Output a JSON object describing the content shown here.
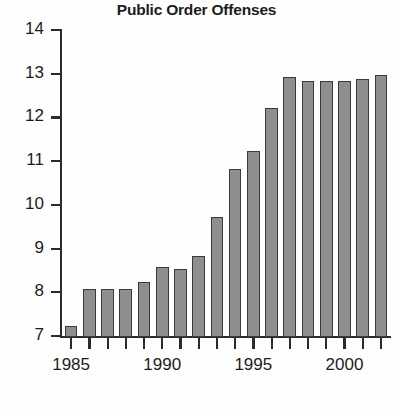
{
  "chart_data": {
    "type": "bar",
    "title": "Public Order Offenses",
    "xlabel": "",
    "ylabel": "",
    "ylim": [
      7,
      14
    ],
    "yticks": [
      7,
      8,
      9,
      10,
      11,
      12,
      13,
      14
    ],
    "ytick_labels": [
      "7",
      "8",
      "9",
      "10",
      "11",
      "12",
      "13",
      "14"
    ],
    "xlim": [
      1984.5,
      2002.5
    ],
    "xtick_labels": [
      "1985",
      "1990",
      "1995",
      "2000"
    ],
    "xticks_major": [
      1985,
      1990,
      1995,
      2000
    ],
    "grid": false,
    "legend": false,
    "bar_color": "#8e8e8e",
    "bar_edge_color": "#3a3a3a",
    "axis_color": "#2b2b2b",
    "categories": [
      "1985",
      "1986",
      "1987",
      "1988",
      "1989",
      "1990",
      "1991",
      "1992",
      "1993",
      "1994",
      "1995",
      "1996",
      "1997",
      "1998",
      "1999",
      "2000",
      "2001",
      "2002"
    ],
    "values": [
      7.25,
      8.1,
      8.1,
      8.1,
      8.25,
      8.6,
      8.55,
      8.85,
      9.75,
      10.85,
      11.25,
      12.25,
      12.95,
      12.85,
      12.85,
      12.85,
      12.9,
      13.0
    ]
  }
}
